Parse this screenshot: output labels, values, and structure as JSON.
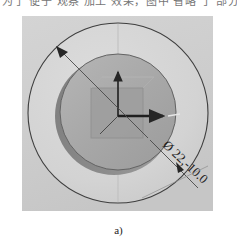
{
  "page": {
    "top_text_fragment": "为了 便于 观察 加工 效果，图中 省略 了 部分 刀具 轨迹"
  },
  "figure": {
    "caption": "a)",
    "panel_background_color": "#cfcfcf",
    "annotations": {
      "diameter_dimension": {
        "symbol": "Ø",
        "value": "22,-10.0",
        "full_text": "Ø 22,-10.0",
        "leader_angle_deg": 42
      },
      "origin_marker": {
        "name": "workpiece-coordinate-origin",
        "axis_x_label": "",
        "axis_y_label": ""
      }
    },
    "geometry": {
      "outer_circle": {
        "name": "stock-boundary-circle",
        "cx": 96,
        "cy": 97,
        "r": 90,
        "stroke_color": "#3a3a3a",
        "fill_color": "#d6d6d6"
      },
      "inner_circle": {
        "name": "machined-cylinder",
        "cx": 95,
        "cy": 96,
        "r": 58,
        "stroke_color": "#5a5a5a",
        "fill_color": "#a9a9a9"
      },
      "cylinder_shadow": {
        "name": "cylinder-side-shading",
        "fill_color": "#8e8e8e"
      },
      "pocket_square": {
        "name": "square-pocket-feature",
        "x": 67,
        "y": 70,
        "size": 52,
        "fill_color": "#9c9c9c"
      }
    },
    "colors": {
      "panel": "#cfcfcf",
      "stock_face": "#d6d6d6",
      "cylinder_top": "#a9a9a9",
      "cylinder_side": "#8e8e8e",
      "pocket": "#9c9c9c",
      "line_dark": "#3a3a3a",
      "line_light": "#b8b8b8",
      "text": "#1e1e1e"
    }
  }
}
